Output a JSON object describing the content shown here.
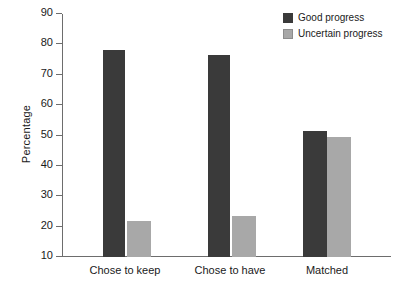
{
  "chart_data": {
    "type": "bar",
    "title": "",
    "xlabel": "",
    "ylabel": "Percentage",
    "ylim": [
      10,
      90
    ],
    "yticks": [
      10,
      20,
      30,
      40,
      50,
      60,
      70,
      80,
      90
    ],
    "ytick_labels": [
      "10",
      "20",
      "30",
      "40",
      "50",
      "60",
      "70",
      "80",
      "90"
    ],
    "grid": false,
    "legend_position": "top-right",
    "categories": [
      "Chose to keep",
      "Chose to have",
      "Matched"
    ],
    "series": [
      {
        "name": "Good progress",
        "color": "#3a3a3a",
        "values": [
          78.0,
          76.5,
          51.5
        ]
      },
      {
        "name": "Uncertain progress",
        "color": "#a8a8a8",
        "values": [
          22.0,
          23.5,
          49.5
        ]
      }
    ]
  },
  "colors": {
    "good_progress": "#3a3a3a",
    "uncertain_progress": "#a8a8a8",
    "axis": "#6d6d6d",
    "text": "#1a1a1a",
    "background": "#ffffff"
  }
}
